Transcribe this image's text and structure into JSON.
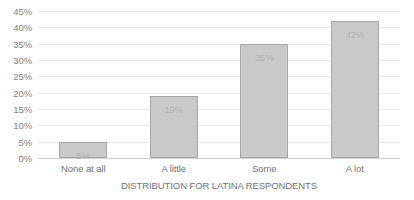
{
  "chart_data": {
    "type": "bar",
    "title": "",
    "xlabel": "DISTRIBUTION FOR LATINA RESPONDENTS",
    "ylabel": "",
    "categories": [
      "None at all",
      "A little",
      "Some",
      "A lot"
    ],
    "values": [
      5,
      19,
      35,
      42
    ],
    "data_labels": [
      "5%",
      "19%",
      "35%",
      "42%"
    ],
    "ylim": [
      0,
      45
    ],
    "ytick_values": [
      0,
      5,
      10,
      15,
      20,
      25,
      30,
      35,
      40,
      45
    ],
    "ytick_labels": [
      "0%",
      "5%",
      "10%",
      "15%",
      "20%",
      "25%",
      "30%",
      "35%",
      "40%",
      "45%"
    ],
    "grid": true,
    "legend": "none",
    "orientation": "vertical",
    "colors": {
      "bar_fill": "#c9c9c9",
      "bar_border": "#a8a8a8",
      "gridline": "#e8e8ea",
      "axis_line": "#d0d0d4",
      "tick_text": "#808285",
      "category_text": "#6f7377",
      "data_label_text": "#b2b2b2",
      "background": "#ffffff"
    }
  }
}
